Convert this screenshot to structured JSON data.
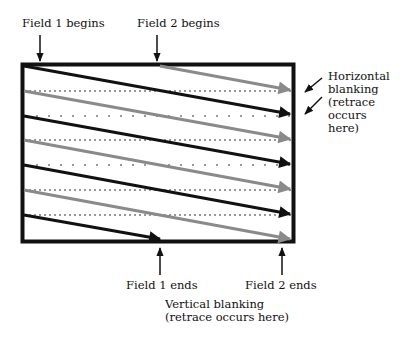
{
  "labels": {
    "field1_begins": "Field 1 begins",
    "field2_begins": "Field 2 begins",
    "field1_ends": "Field 1 ends",
    "field2_ends": "Field 2 ends",
    "horizontal_blanking": [
      "Horizontal",
      "blanking",
      "(retrace",
      "occurs",
      "here)"
    ],
    "vertical_blanking": [
      "Vertical blanking",
      "(retrace occurs here)"
    ]
  },
  "colors": {
    "field1_line": "#111111",
    "field2_line": "#8a8a8a",
    "frame": "#111111",
    "retrace": "#777777"
  },
  "frame": {
    "x": 21,
    "y": 63,
    "width": 274,
    "height": 180
  },
  "scan_lines": {
    "field1": [
      {
        "x1": 24,
        "y1": 66,
        "x2": 292,
        "y2": 115
      },
      {
        "x1": 24,
        "y1": 116,
        "x2": 292,
        "y2": 165
      },
      {
        "x1": 24,
        "y1": 165,
        "x2": 292,
        "y2": 215
      },
      {
        "x1": 24,
        "y1": 215,
        "x2": 160,
        "y2": 240
      }
    ],
    "field2": [
      {
        "x1": 160,
        "y1": 66,
        "x2": 292,
        "y2": 90
      },
      {
        "x1": 24,
        "y1": 91,
        "x2": 292,
        "y2": 140
      },
      {
        "x1": 24,
        "y1": 140,
        "x2": 292,
        "y2": 190
      },
      {
        "x1": 24,
        "y1": 190,
        "x2": 292,
        "y2": 240
      }
    ],
    "retraces_y": [
      91,
      116,
      140,
      165,
      190,
      215
    ]
  }
}
